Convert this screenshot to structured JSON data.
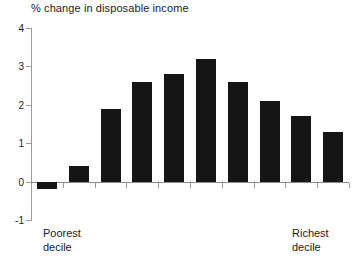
{
  "chart_data": {
    "type": "bar",
    "title": "% change in disposable income",
    "xlabel": "",
    "ylabel": "",
    "categories": [
      "1",
      "2",
      "3",
      "4",
      "5",
      "6",
      "7",
      "8",
      "9",
      "10"
    ],
    "values": [
      -0.2,
      0.4,
      1.9,
      2.6,
      2.8,
      3.2,
      2.6,
      2.1,
      1.7,
      1.3
    ],
    "ylim": [
      -1,
      4
    ],
    "yticks": [
      4,
      3,
      2,
      1,
      0,
      -1
    ],
    "ytick_labels": [
      "4",
      "3",
      "2",
      "1",
      "0",
      "-1"
    ],
    "grid": false,
    "legend": null,
    "bar_color": "#151515",
    "axis_color": "#9a9a9a",
    "text_color": "#1a1a1a",
    "annotations": [
      {
        "text_line1": "Poorest",
        "text_line2": "decile",
        "position": "bottom-left"
      },
      {
        "text_line1": "Richest",
        "text_line2": "decile",
        "position": "bottom-right"
      }
    ]
  },
  "axis": {
    "y_labels": [
      "4",
      "3",
      "2",
      "1",
      "0",
      "-1"
    ]
  },
  "labels": {
    "poorest_line1": "Poorest",
    "poorest_line2": "decile",
    "richest_line1": "Richest",
    "richest_line2": "decile"
  }
}
